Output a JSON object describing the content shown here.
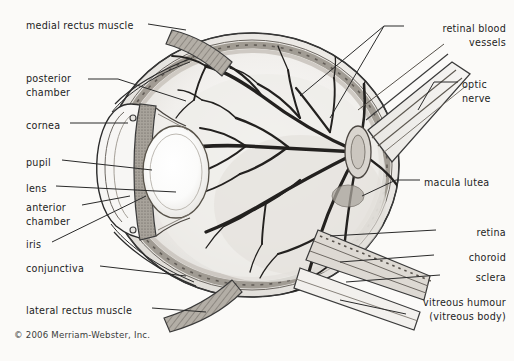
{
  "figure": {
    "credit": "© 2006 Merriam-Webster, Inc.",
    "background_color": "#fbfaf8",
    "ink_color": "#1d1d1d",
    "leader_color": "#2a2a2a"
  },
  "labels_left": [
    {
      "id": "medial-rectus-muscle",
      "text": "medial rectus muscle",
      "x": 26,
      "y": 19
    },
    {
      "id": "posterior-chamber",
      "text": "posterior",
      "x": 26,
      "y": 72
    },
    {
      "id": "posterior-chamber-2",
      "text": "chamber",
      "x": 26,
      "y": 86
    },
    {
      "id": "cornea",
      "text": "cornea",
      "x": 26,
      "y": 119
    },
    {
      "id": "pupil",
      "text": "pupil",
      "x": 26,
      "y": 156
    },
    {
      "id": "lens",
      "text": "lens",
      "x": 26,
      "y": 182
    },
    {
      "id": "anterior-chamber",
      "text": "anterior",
      "x": 26,
      "y": 201
    },
    {
      "id": "anterior-chamber-2",
      "text": "chamber",
      "x": 26,
      "y": 215
    },
    {
      "id": "iris",
      "text": "iris",
      "x": 26,
      "y": 238
    },
    {
      "id": "conjunctiva",
      "text": "conjunctiva",
      "x": 26,
      "y": 262
    },
    {
      "id": "lateral-rectus-muscle",
      "text": "lateral rectus muscle",
      "x": 26,
      "y": 304
    }
  ],
  "labels_right": [
    {
      "id": "retinal-blood-vessels",
      "text": "retinal blood",
      "right": 8,
      "y": 22,
      "align": "right"
    },
    {
      "id": "retinal-blood-vessels-2",
      "text": "vessels",
      "right": 8,
      "y": 36,
      "align": "right"
    },
    {
      "id": "optic-nerve",
      "text": "optic",
      "x": 462,
      "y": 78,
      "align": "left"
    },
    {
      "id": "optic-nerve-2",
      "text": "nerve",
      "x": 462,
      "y": 92,
      "align": "left"
    },
    {
      "id": "macula-lutea",
      "text": "macula lutea",
      "x": 424,
      "y": 176,
      "align": "left"
    },
    {
      "id": "retina",
      "text": "retina",
      "right": 8,
      "y": 226,
      "align": "right"
    },
    {
      "id": "choroid",
      "text": "choroid",
      "right": 8,
      "y": 251,
      "align": "right"
    },
    {
      "id": "sclera",
      "text": "sclera",
      "right": 8,
      "y": 271,
      "align": "right"
    },
    {
      "id": "vitreous-humour",
      "text": "vitreous humour",
      "right": 8,
      "y": 296,
      "align": "right"
    },
    {
      "id": "vitreous-body",
      "text": "(vitreous body)",
      "right": 8,
      "y": 310,
      "align": "right"
    }
  ],
  "anatomy_parts": [
    "medial rectus muscle",
    "posterior chamber",
    "cornea",
    "pupil",
    "lens",
    "anterior chamber",
    "iris",
    "conjunctiva",
    "lateral rectus muscle",
    "retinal blood vessels",
    "optic nerve",
    "macula lutea",
    "retina",
    "choroid",
    "sclera",
    "vitreous humour (vitreous body)"
  ]
}
